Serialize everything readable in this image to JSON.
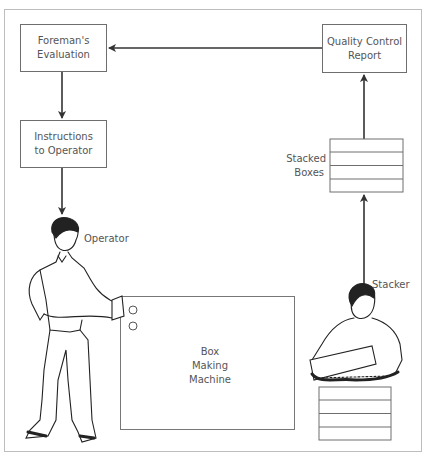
{
  "diagram": {
    "nodes": {
      "foreman": {
        "line1": "Foreman's",
        "line2": "Evaluation"
      },
      "instructions": {
        "line1": "Instructions",
        "line2": "to Operator"
      },
      "quality": {
        "line1": "Quality Control",
        "line2": "Report"
      },
      "stacked": {
        "line1": "Stacked",
        "line2": "Boxes"
      },
      "machine": {
        "line1": "Box",
        "line2": "Making",
        "line3": "Machine"
      }
    },
    "figures": {
      "operator": {
        "label": "Operator"
      },
      "stacker": {
        "label": "Stacker"
      }
    },
    "edges": [
      {
        "from": "Quality Control Report",
        "to": "Foreman's Evaluation"
      },
      {
        "from": "Foreman's Evaluation",
        "to": "Instructions to Operator"
      },
      {
        "from": "Instructions to Operator",
        "to": "Operator"
      },
      {
        "from": "Stacker",
        "to": "Stacked Boxes"
      },
      {
        "from": "Stacked Boxes",
        "to": "Quality Control Report"
      }
    ],
    "colors": {
      "line": "#333333",
      "box_border": "#6e6e6e",
      "frame": "#bdbdbd",
      "text": "#555555"
    }
  }
}
